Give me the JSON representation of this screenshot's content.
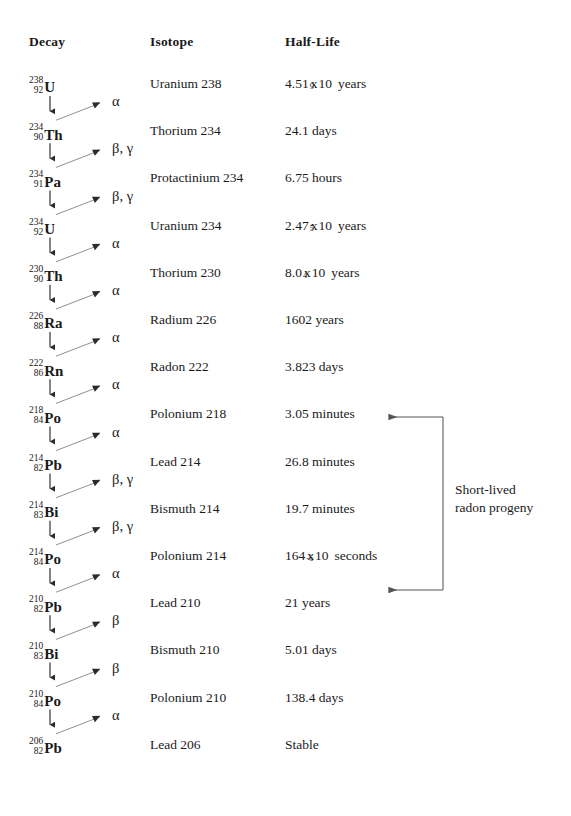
{
  "headers": {
    "decay": "Decay",
    "isotope": "Isotope",
    "half_life": "Half-Life"
  },
  "chart_data": {
    "type": "diagram",
    "columns": [
      "Decay",
      "Isotope",
      "Half-Life"
    ],
    "rows": [
      {
        "mass": "238",
        "atomic": "92",
        "symbol": "U",
        "isotope": "Uranium 238",
        "half_life_text": "4.51 x 10⁹ years",
        "coefficient": "4.51",
        "exponent": "9",
        "base": "10",
        "unit": "years",
        "decay_mode": "α"
      },
      {
        "mass": "234",
        "atomic": "90",
        "symbol": "Th",
        "isotope": "Thorium 234",
        "half_life_text": "24.1 days",
        "coefficient": "24.1",
        "exponent": "",
        "base": "",
        "unit": "days",
        "decay_mode": "β, γ"
      },
      {
        "mass": "234",
        "atomic": "91",
        "symbol": "Pa",
        "isotope": "Protactinium 234",
        "half_life_text": "6.75 hours",
        "coefficient": "6.75",
        "exponent": "",
        "base": "",
        "unit": "hours",
        "decay_mode": "β, γ"
      },
      {
        "mass": "234",
        "atomic": "92",
        "symbol": "U",
        "isotope": "Uranium 234",
        "half_life_text": "2.47 x 10⁵ years",
        "coefficient": "2.47",
        "exponent": "5",
        "base": "10",
        "unit": "years",
        "decay_mode": "α"
      },
      {
        "mass": "230",
        "atomic": "90",
        "symbol": "Th",
        "isotope": "Thorium 230",
        "half_life_text": "8.0 x 10⁴ years",
        "coefficient": "8.0",
        "exponent": "4",
        "base": "10",
        "unit": "years",
        "decay_mode": "α"
      },
      {
        "mass": "226",
        "atomic": "88",
        "symbol": "Ra",
        "isotope": "Radium 226",
        "half_life_text": "1602 years",
        "coefficient": "1602",
        "exponent": "",
        "base": "",
        "unit": "years",
        "decay_mode": "α"
      },
      {
        "mass": "222",
        "atomic": "86",
        "symbol": "Rn",
        "isotope": "Radon 222",
        "half_life_text": "3.823 days",
        "coefficient": "3.823",
        "exponent": "",
        "base": "",
        "unit": "days",
        "decay_mode": "α"
      },
      {
        "mass": "218",
        "atomic": "84",
        "symbol": "Po",
        "isotope": "Polonium 218",
        "half_life_text": "3.05 minutes",
        "coefficient": "3.05",
        "exponent": "",
        "base": "",
        "unit": "minutes",
        "decay_mode": "α"
      },
      {
        "mass": "214",
        "atomic": "82",
        "symbol": "Pb",
        "isotope": "Lead 214",
        "half_life_text": "26.8 minutes",
        "coefficient": "26.8",
        "exponent": "",
        "base": "",
        "unit": "minutes",
        "decay_mode": "β, γ"
      },
      {
        "mass": "214",
        "atomic": "83",
        "symbol": "Bi",
        "isotope": "Bismuth 214",
        "half_life_text": "19.7 minutes",
        "coefficient": "19.7",
        "exponent": "",
        "base": "",
        "unit": "minutes",
        "decay_mode": "β, γ"
      },
      {
        "mass": "214",
        "atomic": "84",
        "symbol": "Po",
        "isotope": "Polonium 214",
        "half_life_text": "164 x 10⁻⁶ seconds",
        "coefficient": "164",
        "exponent": "-6",
        "base": "10",
        "unit": "seconds",
        "decay_mode": "α"
      },
      {
        "mass": "210",
        "atomic": "82",
        "symbol": "Pb",
        "isotope": "Lead 210",
        "half_life_text": "21 years",
        "coefficient": "21",
        "exponent": "",
        "base": "",
        "unit": "years",
        "decay_mode": "β"
      },
      {
        "mass": "210",
        "atomic": "83",
        "symbol": "Bi",
        "isotope": "Bismuth 210",
        "half_life_text": "5.01 days",
        "coefficient": "5.01",
        "exponent": "",
        "base": "",
        "unit": "days",
        "decay_mode": "β"
      },
      {
        "mass": "210",
        "atomic": "84",
        "symbol": "Po",
        "isotope": "Polonium 210",
        "half_life_text": "138.4 days",
        "coefficient": "138.4",
        "exponent": "",
        "base": "",
        "unit": "days",
        "decay_mode": "α"
      },
      {
        "mass": "206",
        "atomic": "82",
        "symbol": "Pb",
        "isotope": "Lead 206",
        "half_life_text": "Stable",
        "coefficient": "Stable",
        "exponent": "",
        "base": "",
        "unit": "",
        "decay_mode": ""
      }
    ]
  },
  "annotation": {
    "line1": "Short-lived",
    "line2": "radon progeny",
    "spans_from": "Polonium 218",
    "spans_to": "Polonium 214"
  },
  "colors": {
    "text": "#1a1a1a",
    "arrow": "#2b2b2b",
    "bracket": "#555555",
    "background": "#ffffff"
  }
}
